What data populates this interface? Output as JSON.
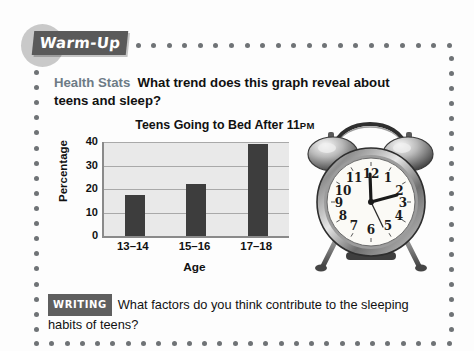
{
  "header": {
    "tag_label": "Warm-Up"
  },
  "health_stats": {
    "label": "Health Stats",
    "question": "What trend does this graph reveal about teens and sleep?"
  },
  "writing": {
    "badge": "WRITING",
    "question": "What factors do you think contribute to the sleeping habits of teens?"
  },
  "chart_data": {
    "type": "bar",
    "title": "Teens Going to Bed After 11",
    "title_suffix": "PM",
    "categories": [
      "13–14",
      "15–16",
      "17–18"
    ],
    "values": [
      17.5,
      22,
      39
    ],
    "xlabel": "Age",
    "ylabel": "Percentage",
    "ylim": [
      0,
      40
    ],
    "yticks": [
      "40",
      "30",
      "20",
      "10",
      "0"
    ],
    "grid": true,
    "legend": "none",
    "bar_color": "#3d3d3d",
    "plot_background": "#e9e9e9"
  },
  "illustration": {
    "name": "alarm-clock",
    "numerals": [
      "12",
      "1",
      "2",
      "3",
      "4",
      "5",
      "6",
      "7",
      "8",
      "9",
      "10",
      "11"
    ],
    "time_shown": "12:10"
  },
  "colors": {
    "tag_background": "#5a5a5a",
    "tag_circle": "#c9c9c9",
    "label_accent": "#6d7b86",
    "border_dot": "#6f7376"
  }
}
